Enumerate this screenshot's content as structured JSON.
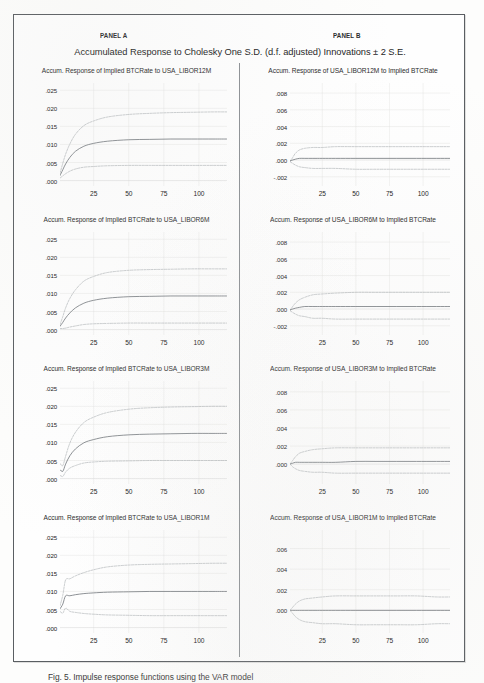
{
  "header": {
    "panel_a_label": "PANEL A",
    "panel_b_label": "PANEL B",
    "title": "Accumulated Response to Cholesky One S.D. (d.f. adjusted) Innovations ± 2 S.E."
  },
  "caption": "Fig. 5. Impulse response functions using the VAR model",
  "axes": {
    "xticks": [
      "25",
      "50",
      "75",
      "100"
    ],
    "xtick_values": [
      25,
      50,
      75,
      100
    ],
    "xlim": [
      1,
      120
    ],
    "panel_a_yticks": [
      ".000",
      ".005",
      ".010",
      ".015",
      ".020",
      ".025"
    ],
    "panel_a_ytick_values": [
      0.0,
      0.005,
      0.01,
      0.015,
      0.02,
      0.025
    ],
    "panel_a_ylim": [
      -0.0015,
      0.027
    ],
    "panel_b_yticks_full": [
      "-.002",
      ".000",
      ".002",
      ".004",
      ".006",
      ".008"
    ],
    "panel_b_ytick_values_full": [
      -0.002,
      0.0,
      0.002,
      0.004,
      0.006,
      0.008
    ],
    "panel_b_ylim_full": [
      -0.0031,
      0.0092
    ],
    "panel_b_yticks_short": [
      ".000",
      ".002",
      ".004",
      ".006"
    ],
    "panel_b_ytick_values_short": [
      0.0,
      0.002,
      0.004,
      0.006
    ],
    "panel_b_ylim_short": [
      -0.0022,
      0.0078
    ]
  },
  "colors": {
    "frame": "#5a5e62",
    "divider": "#8d9195",
    "center_line": "#6f7479",
    "band_line": "#a9adb1",
    "grid": "#dcdcd8",
    "zero_line": "#c4c6c4",
    "text": "#202020"
  },
  "chart_data": [
    {
      "type": "line",
      "panel": "A",
      "title": "Accum. Response of Implied BTCRate to USA_LIBOR12M",
      "xlabel": "",
      "ylabel": "",
      "ylim": [
        -0.0015,
        0.027
      ],
      "xlim": [
        1,
        120
      ],
      "grid": true,
      "legend": "none",
      "x": [
        1,
        3,
        5,
        8,
        12,
        18,
        25,
        35,
        50,
        65,
        80,
        95,
        110,
        120
      ],
      "series": [
        {
          "name": "Upper +2 S.E.",
          "values": [
            0.002,
            0.0048,
            0.0073,
            0.0101,
            0.0128,
            0.0152,
            0.0165,
            0.0176,
            0.0183,
            0.0186,
            0.0188,
            0.0189,
            0.019,
            0.019
          ]
        },
        {
          "name": "Accumulated response",
          "values": [
            0.0014,
            0.003,
            0.0046,
            0.0064,
            0.0081,
            0.0095,
            0.0103,
            0.0109,
            0.0113,
            0.0114,
            0.0115,
            0.0115,
            0.0115,
            0.0115
          ]
        },
        {
          "name": "Lower -2 S.E.",
          "values": [
            0.0007,
            0.0013,
            0.0019,
            0.0026,
            0.0032,
            0.0037,
            0.0039,
            0.0041,
            0.0042,
            0.0042,
            0.0042,
            0.0042,
            0.0042,
            0.0042
          ]
        }
      ]
    },
    {
      "type": "line",
      "panel": "B",
      "title": "Accum. Response of USA_LIBOR12M to Implied BTCRate",
      "xlabel": "",
      "ylabel": "",
      "ylim": [
        -0.0031,
        0.0092
      ],
      "xlim": [
        1,
        120
      ],
      "grid": true,
      "legend": "none",
      "x": [
        1,
        3,
        5,
        8,
        12,
        18,
        25,
        35,
        50,
        65,
        80,
        95,
        110,
        120
      ],
      "series": [
        {
          "name": "Upper +2 S.E.",
          "values": [
            -0.0002,
            0.0003,
            0.0008,
            0.0012,
            0.0014,
            0.0015,
            0.0015,
            0.0016,
            0.0016,
            0.0016,
            0.0016,
            0.0016,
            0.0016,
            0.0016
          ]
        },
        {
          "name": "Accumulated response",
          "values": [
            -0.0001,
            0.0,
            0.0001,
            0.0002,
            0.0002,
            0.0002,
            0.0002,
            0.0002,
            0.0002,
            0.0002,
            0.0002,
            0.0002,
            0.0002,
            0.0002
          ]
        },
        {
          "name": "Lower -2 S.E.",
          "values": [
            -0.0002,
            -0.0004,
            -0.0006,
            -0.0008,
            -0.0009,
            -0.001,
            -0.001,
            -0.001,
            -0.0011,
            -0.0011,
            -0.0011,
            -0.0011,
            -0.0011,
            -0.0011
          ]
        }
      ]
    },
    {
      "type": "line",
      "panel": "A",
      "title": "Accum. Response of Implied BTCRate to USA_LIBOR6M",
      "xlabel": "",
      "ylabel": "",
      "ylim": [
        -0.0015,
        0.027
      ],
      "xlim": [
        1,
        120
      ],
      "grid": true,
      "legend": "none",
      "x": [
        1,
        3,
        5,
        8,
        12,
        18,
        25,
        35,
        50,
        65,
        80,
        95,
        110,
        120
      ],
      "series": [
        {
          "name": "Upper +2 S.E.",
          "values": [
            0.0014,
            0.0036,
            0.006,
            0.0086,
            0.011,
            0.0134,
            0.0147,
            0.0158,
            0.0164,
            0.0166,
            0.0167,
            0.0168,
            0.0168,
            0.0168
          ]
        },
        {
          "name": "Accumulated response",
          "values": [
            0.0009,
            0.002,
            0.0032,
            0.0046,
            0.006,
            0.0073,
            0.0081,
            0.0087,
            0.0091,
            0.0092,
            0.0093,
            0.0093,
            0.0093,
            0.0093
          ]
        },
        {
          "name": "Lower -2 S.E.",
          "values": [
            0.0003,
            0.0003,
            0.0004,
            0.0007,
            0.001,
            0.0014,
            0.0016,
            0.0017,
            0.0018,
            0.0018,
            0.0018,
            0.0018,
            0.0018,
            0.0018
          ]
        }
      ]
    },
    {
      "type": "line",
      "panel": "B",
      "title": "Accum. Response of USA_LIBOR6M to Implied BTCRate",
      "xlabel": "",
      "ylabel": "",
      "ylim": [
        -0.0031,
        0.0092
      ],
      "xlim": [
        1,
        120
      ],
      "grid": true,
      "legend": "none",
      "x": [
        1,
        3,
        5,
        8,
        12,
        18,
        25,
        35,
        50,
        65,
        80,
        95,
        110,
        120
      ],
      "series": [
        {
          "name": "Upper +2 S.E.",
          "values": [
            -0.0002,
            0.0003,
            0.0007,
            0.0011,
            0.0014,
            0.0017,
            0.0018,
            0.0019,
            0.002,
            0.002,
            0.002,
            0.002,
            0.002,
            0.002
          ]
        },
        {
          "name": "Accumulated response",
          "values": [
            -0.0001,
            0.0,
            0.0001,
            0.0002,
            0.0003,
            0.0003,
            0.0003,
            0.0003,
            0.0003,
            0.0003,
            0.0003,
            0.0003,
            0.0003,
            0.0003
          ]
        },
        {
          "name": "Lower -2 S.E.",
          "values": [
            -0.0002,
            -0.0004,
            -0.0006,
            -0.0008,
            -0.0009,
            -0.0011,
            -0.0011,
            -0.0012,
            -0.0012,
            -0.0012,
            -0.0012,
            -0.0012,
            -0.0012,
            -0.0012
          ]
        }
      ]
    },
    {
      "type": "line",
      "panel": "A",
      "title": "Accum. Response of Implied BTCRate to USA_LIBOR3M",
      "xlabel": "",
      "ylabel": "",
      "ylim": [
        -0.0015,
        0.027
      ],
      "xlim": [
        1,
        120
      ],
      "grid": true,
      "legend": "none",
      "x": [
        1,
        3,
        5,
        8,
        12,
        18,
        25,
        35,
        50,
        65,
        80,
        95,
        110,
        120
      ],
      "series": [
        {
          "name": "Upper +2 S.E.",
          "values": [
            0.0042,
            0.0036,
            0.0062,
            0.0098,
            0.0128,
            0.0155,
            0.017,
            0.0183,
            0.0192,
            0.0196,
            0.0198,
            0.0199,
            0.02,
            0.02
          ]
        },
        {
          "name": "Accumulated response",
          "values": [
            0.0025,
            0.002,
            0.004,
            0.0063,
            0.0082,
            0.0099,
            0.0108,
            0.0116,
            0.0121,
            0.0123,
            0.0124,
            0.0125,
            0.0125,
            0.0125
          ]
        },
        {
          "name": "Lower -2 S.E.",
          "values": [
            0.0009,
            0.0006,
            0.0018,
            0.0029,
            0.0036,
            0.0043,
            0.0046,
            0.0048,
            0.0049,
            0.005,
            0.005,
            0.005,
            0.005,
            0.005
          ]
        }
      ]
    },
    {
      "type": "line",
      "panel": "B",
      "title": "Accum. Response of USA_LIBOR3M to Implied BTCRate",
      "xlabel": "",
      "ylabel": "",
      "ylim": [
        -0.0022,
        0.0092
      ],
      "xlim": [
        1,
        120
      ],
      "grid": true,
      "legend": "none",
      "x": [
        1,
        3,
        5,
        8,
        12,
        18,
        25,
        35,
        50,
        65,
        80,
        95,
        110,
        120
      ],
      "series": [
        {
          "name": "Upper +2 S.E.",
          "values": [
            0.0,
            0.0004,
            0.0008,
            0.0012,
            0.0014,
            0.0016,
            0.0017,
            0.0018,
            0.0018,
            0.0018,
            0.0018,
            0.0018,
            0.0018,
            0.0018
          ]
        },
        {
          "name": "Accumulated response",
          "values": [
            0.0,
            0.0001,
            0.0002,
            0.0002,
            0.0002,
            0.0002,
            0.0002,
            0.0002,
            0.0003,
            0.0003,
            0.0003,
            0.0003,
            0.0003,
            0.0003
          ]
        },
        {
          "name": "Lower -2 S.E.",
          "values": [
            0.0,
            -0.0003,
            -0.0005,
            -0.0007,
            -0.0008,
            -0.0009,
            -0.0009,
            -0.001,
            -0.001,
            -0.001,
            -0.001,
            -0.001,
            -0.001,
            -0.001
          ]
        }
      ]
    },
    {
      "type": "line",
      "panel": "A",
      "title": "Accum. Response of Implied BTCRate to USA_LIBOR1M",
      "xlabel": "",
      "ylabel": "",
      "ylim": [
        -0.0015,
        0.027
      ],
      "xlim": [
        1,
        120
      ],
      "grid": true,
      "legend": "none",
      "x": [
        1,
        3,
        5,
        8,
        12,
        18,
        25,
        35,
        50,
        65,
        80,
        95,
        110,
        120
      ],
      "series": [
        {
          "name": "Upper +2 S.E.",
          "values": [
            0.006,
            0.009,
            0.0132,
            0.0135,
            0.0143,
            0.0152,
            0.016,
            0.0168,
            0.0173,
            0.0175,
            0.0176,
            0.0177,
            0.0178,
            0.0178
          ]
        },
        {
          "name": "Accumulated response",
          "values": [
            0.0052,
            0.0065,
            0.0088,
            0.0088,
            0.0091,
            0.0094,
            0.0096,
            0.0098,
            0.0099,
            0.01,
            0.01,
            0.01,
            0.01,
            0.01
          ]
        },
        {
          "name": "Lower -2 S.E.",
          "values": [
            0.0045,
            0.004,
            0.0054,
            0.0045,
            0.0042,
            0.0039,
            0.0037,
            0.0035,
            0.0034,
            0.0033,
            0.0033,
            0.0033,
            0.0033,
            0.0033
          ]
        }
      ]
    },
    {
      "type": "line",
      "panel": "B",
      "title": "Accum. Response of USA_LIBOR1M to Implied BTCRate",
      "xlabel": "",
      "ylabel": "",
      "ylim": [
        -0.0022,
        0.0078
      ],
      "xlim": [
        1,
        120
      ],
      "grid": true,
      "legend": "none",
      "x": [
        1,
        3,
        5,
        8,
        12,
        18,
        25,
        35,
        50,
        65,
        80,
        95,
        110,
        120
      ],
      "series": [
        {
          "name": "Upper +2 S.E.",
          "values": [
            0.0,
            0.0003,
            0.0006,
            0.0009,
            0.0011,
            0.0012,
            0.0013,
            0.0014,
            0.0014,
            0.0014,
            0.0014,
            0.0014,
            0.0013,
            0.0013
          ]
        },
        {
          "name": "Accumulated response",
          "values": [
            0.0,
            0.0,
            0.0,
            0.0,
            0.0,
            0.0,
            0.0,
            0.0,
            0.0,
            0.0,
            0.0,
            0.0,
            0.0,
            0.0
          ]
        },
        {
          "name": "Lower -2 S.E.",
          "values": [
            0.0,
            -0.0003,
            -0.0006,
            -0.0009,
            -0.0011,
            -0.0012,
            -0.0013,
            -0.0013,
            -0.0014,
            -0.0014,
            -0.0014,
            -0.0014,
            -0.0013,
            -0.0013
          ]
        }
      ]
    }
  ]
}
